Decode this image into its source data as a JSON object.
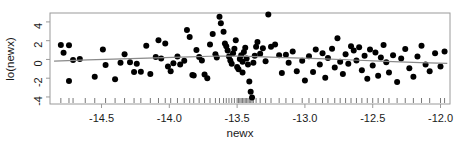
{
  "chart_data": {
    "type": "scatter",
    "title": "",
    "subtitle": "",
    "xlabel": "newx",
    "ylabel": "lo(newx)",
    "xlim": [
      -14.88,
      -11.93
    ],
    "ylim": [
      -4.75,
      4.95
    ],
    "xticks": [
      -14.5,
      -14.0,
      -13.5,
      -13.0,
      -12.5,
      -12.0
    ],
    "xticklabels": [
      "-14.5",
      "-14.0",
      "-13.5",
      "-13.0",
      "-12.5",
      "-12.0"
    ],
    "yticks": [
      4,
      2,
      0,
      -2,
      -4
    ],
    "yticklabels": [
      "4",
      "2",
      "0",
      "-2",
      "-4"
    ],
    "grid": false,
    "legend": null,
    "marker": "filled-circle",
    "marker_color": "#000000",
    "marker_size_px": 3.0,
    "line_color": "#8a8a8a",
    "frame_color": "#9a9a9a",
    "background": "#ffffff",
    "rug": true,
    "points": [
      [
        -14.8,
        1.55
      ],
      [
        -14.78,
        0.7
      ],
      [
        -14.74,
        1.5
      ],
      [
        -14.74,
        -2.3
      ],
      [
        -14.71,
        -0.05
      ],
      [
        -14.66,
        0.05
      ],
      [
        -14.55,
        -1.85
      ],
      [
        -14.49,
        1.05
      ],
      [
        -14.47,
        -0.6
      ],
      [
        -14.4,
        -2.1
      ],
      [
        -14.36,
        -0.35
      ],
      [
        -14.33,
        0.55
      ],
      [
        -14.29,
        -0.3
      ],
      [
        -14.26,
        -1.35
      ],
      [
        -14.24,
        -0.45
      ],
      [
        -14.21,
        -1.3
      ],
      [
        -14.17,
        1.45
      ],
      [
        -14.14,
        -1.55
      ],
      [
        -14.1,
        0.25
      ],
      [
        -14.08,
        2.05
      ],
      [
        -14.06,
        0.1
      ],
      [
        -14.03,
        1.7
      ],
      [
        -14.01,
        -0.75
      ],
      [
        -13.99,
        -1.25
      ],
      [
        -13.97,
        -0.4
      ],
      [
        -13.94,
        0.3
      ],
      [
        -13.92,
        -0.55
      ],
      [
        -13.89,
        -0.15
      ],
      [
        -13.87,
        3.15
      ],
      [
        -13.85,
        2.4
      ],
      [
        -13.83,
        -1.65
      ],
      [
        -13.82,
        -1.7
      ],
      [
        -13.8,
        1.0
      ],
      [
        -13.78,
        0.25
      ],
      [
        -13.76,
        -0.1
      ],
      [
        -13.74,
        -1.6
      ],
      [
        -13.72,
        -2.0
      ],
      [
        -13.7,
        1.6
      ],
      [
        -13.68,
        2.7
      ],
      [
        -13.66,
        0.55
      ],
      [
        -13.65,
        0.2
      ],
      [
        -13.63,
        4.55
      ],
      [
        -13.62,
        3.85
      ],
      [
        -13.6,
        2.95
      ],
      [
        -13.59,
        1.7
      ],
      [
        -13.58,
        1.4
      ],
      [
        -13.57,
        0.95
      ],
      [
        -13.56,
        0.3
      ],
      [
        -13.55,
        -0.1
      ],
      [
        -13.54,
        -0.45
      ],
      [
        -13.53,
        0.65
      ],
      [
        -13.52,
        1.15
      ],
      [
        -13.51,
        2.05
      ],
      [
        -13.5,
        -0.8
      ],
      [
        -13.49,
        -1.05
      ],
      [
        -13.48,
        0.05
      ],
      [
        -13.47,
        0.45
      ],
      [
        -13.46,
        -0.25
      ],
      [
        -13.46,
        -1.4
      ],
      [
        -13.45,
        0.8
      ],
      [
        -13.44,
        1.25
      ],
      [
        -13.43,
        0.1
      ],
      [
        -13.42,
        -0.55
      ],
      [
        -13.41,
        -2.35
      ],
      [
        -13.4,
        -3.45
      ],
      [
        -13.39,
        -4.05
      ],
      [
        -13.38,
        -0.35
      ],
      [
        -13.37,
        0.4
      ],
      [
        -13.36,
        1.35
      ],
      [
        -13.35,
        1.85
      ],
      [
        -13.33,
        0.6
      ],
      [
        -13.31,
        1.2
      ],
      [
        -13.29,
        -0.2
      ],
      [
        -13.27,
        4.8
      ],
      [
        -13.25,
        1.35
      ],
      [
        -13.22,
        1.6
      ],
      [
        -13.19,
        0.45
      ],
      [
        -13.17,
        -1.45
      ],
      [
        -13.14,
        0.5
      ],
      [
        -13.12,
        -0.35
      ],
      [
        -13.09,
        0.85
      ],
      [
        -13.06,
        -1.25
      ],
      [
        -13.02,
        -0.15
      ],
      [
        -13.0,
        -2.25
      ],
      [
        -12.97,
        0.35
      ],
      [
        -12.94,
        -1.35
      ],
      [
        -12.92,
        1.05
      ],
      [
        -12.89,
        -0.55
      ],
      [
        -12.87,
        0.65
      ],
      [
        -12.85,
        -1.95
      ],
      [
        -12.83,
        0.15
      ],
      [
        -12.8,
        1.15
      ],
      [
        -12.78,
        -0.85
      ],
      [
        -12.76,
        2.25
      ],
      [
        -12.74,
        -0.25
      ],
      [
        -12.72,
        -1.55
      ],
      [
        -12.7,
        0.55
      ],
      [
        -12.68,
        -0.45
      ],
      [
        -12.66,
        1.4
      ],
      [
        -12.64,
        0.95
      ],
      [
        -12.62,
        -0.1
      ],
      [
        -12.6,
        1.3
      ],
      [
        -12.58,
        -1.15
      ],
      [
        -12.56,
        0.4
      ],
      [
        -12.54,
        -2.05
      ],
      [
        -12.52,
        1.05
      ],
      [
        -12.5,
        -0.65
      ],
      [
        -12.48,
        0.75
      ],
      [
        -12.46,
        -1.75
      ],
      [
        -12.44,
        0.2
      ],
      [
        -12.42,
        1.55
      ],
      [
        -12.4,
        -0.3
      ],
      [
        -12.38,
        -1.4
      ],
      [
        -12.35,
        0.45
      ],
      [
        -12.32,
        -2.4
      ],
      [
        -12.29,
        0.1
      ],
      [
        -12.26,
        1.1
      ],
      [
        -12.23,
        -0.95
      ],
      [
        -12.2,
        -1.85
      ],
      [
        -12.17,
        0.3
      ],
      [
        -12.14,
        1.45
      ],
      [
        -12.11,
        -0.55
      ],
      [
        -12.08,
        -1.25
      ],
      [
        -12.04,
        0.65
      ],
      [
        -12.0,
        -0.75
      ],
      [
        -11.97,
        0.85
      ]
    ],
    "rug_x": [
      -14.8,
      -14.74,
      -14.71,
      -14.62,
      -14.55,
      -14.47,
      -14.4,
      -14.33,
      -14.26,
      -14.21,
      -14.14,
      -14.08,
      -14.03,
      -13.99,
      -13.94,
      -13.89,
      -13.85,
      -13.82,
      -13.78,
      -13.74,
      -13.7,
      -13.66,
      -13.63,
      -13.6,
      -13.58,
      -13.56,
      -13.54,
      -13.52,
      -13.5,
      -13.49,
      -13.48,
      -13.47,
      -13.46,
      -13.45,
      -13.44,
      -13.43,
      -13.42,
      -13.41,
      -13.4,
      -13.39,
      -13.38,
      -13.36,
      -13.33,
      -13.29,
      -13.25,
      -13.19,
      -13.14,
      -13.09,
      -13.02,
      -12.97,
      -12.92,
      -12.87,
      -12.83,
      -12.78,
      -12.74,
      -12.7,
      -12.66,
      -12.62,
      -12.58,
      -12.54,
      -12.5,
      -12.46,
      -12.42,
      -12.38,
      -12.32,
      -12.26,
      -12.2,
      -12.14,
      -12.08,
      -12.0,
      -11.97
    ],
    "smooth_line": {
      "name": "loess-smooth",
      "x": [
        -14.85,
        -14.6,
        -14.35,
        -14.1,
        -13.85,
        -13.7,
        -13.6,
        -13.5,
        -13.35,
        -13.15,
        -12.9,
        -12.65,
        -12.4,
        -12.15,
        -11.95
      ],
      "y": [
        -0.18,
        -0.05,
        0.06,
        0.16,
        0.28,
        0.34,
        0.36,
        0.35,
        0.3,
        0.2,
        0.08,
        -0.06,
        -0.2,
        -0.33,
        -0.43
      ]
    }
  }
}
